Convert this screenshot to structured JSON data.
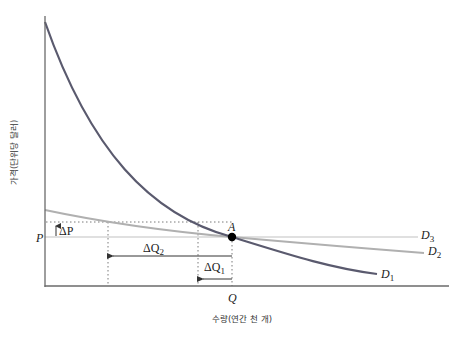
{
  "diagram": {
    "y_axis_label": "가격(단위당 달러)",
    "x_axis_label": "수량(연간 천 개)",
    "price_label": "P",
    "quantity_label": "Q",
    "point_label": "A",
    "delta_p_label": "ΔP",
    "delta_q1_label": "ΔQ",
    "delta_q1_sub": "1",
    "delta_q2_label": "ΔQ",
    "delta_q2_sub": "2",
    "curves": [
      {
        "name": "D",
        "sub": "1",
        "color": "#5a5a6e",
        "description": "steep convex demand curve"
      },
      {
        "name": "D",
        "sub": "2",
        "color": "#b0b0b0",
        "description": "flatter demand curve"
      },
      {
        "name": "D",
        "sub": "3",
        "color": "#e2e2e2",
        "description": "horizontal (perfectly elastic) demand"
      }
    ],
    "colors": {
      "axis": "#6a6a6a",
      "point": "#000000",
      "dotted": "#7a7a7a",
      "arrow": "#333333",
      "text": "#222222"
    }
  }
}
